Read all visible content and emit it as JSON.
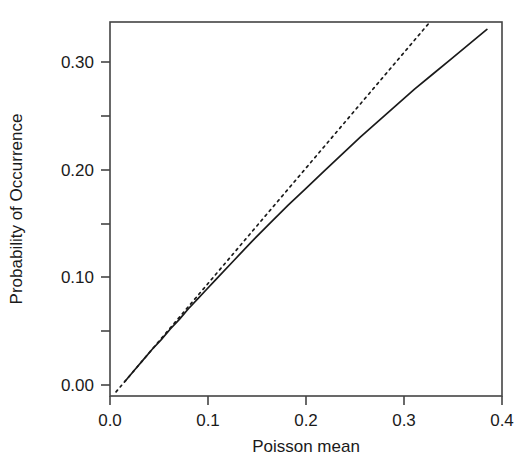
{
  "chart_data": {
    "type": "line",
    "title": "",
    "xlabel": "Poisson mean",
    "ylabel": "Probability of Occurrence",
    "xlim": [
      -0.0167,
      0.4167
    ],
    "ylim": [
      -0.0139,
      0.337
    ],
    "grid": false,
    "legend": "none",
    "xticks": [
      0.0,
      0.1,
      0.2,
      0.3,
      0.4
    ],
    "xtick_labels": [
      "0.0",
      "0.1",
      "0.2",
      "0.3",
      "0.4"
    ],
    "yticks": [
      0.0,
      0.1,
      0.2,
      0.3
    ],
    "ytick_labels": [
      "0.00",
      "0.10",
      "0.20",
      "0.30"
    ],
    "yminor_ticks": [
      0.05,
      0.15,
      0.25
    ],
    "series": [
      {
        "name": "Exact probability of occurrence",
        "style": "solid",
        "color": "#1a1a1a",
        "x": [
          0.0,
          0.01,
          0.02,
          0.03,
          0.04,
          0.05,
          0.06,
          0.07,
          0.08,
          0.09,
          0.1,
          0.12,
          0.14,
          0.16,
          0.18,
          0.2,
          0.22,
          0.24,
          0.26,
          0.28,
          0.3,
          0.32,
          0.34,
          0.36,
          0.38,
          0.4
        ],
        "y": [
          0.0,
          0.01,
          0.02,
          0.03,
          0.039,
          0.049,
          0.058,
          0.068,
          0.077,
          0.086,
          0.095,
          0.113,
          0.131,
          0.148,
          0.165,
          0.181,
          0.197,
          0.213,
          0.229,
          0.244,
          0.259,
          0.274,
          0.288,
          0.302,
          0.316,
          0.33
        ]
      },
      {
        "name": "Linear approximation",
        "style": "dotted",
        "color": "#1a1a1a",
        "x": [
          -0.01,
          0.342
        ],
        "y": [
          -0.01,
          0.342
        ]
      }
    ]
  },
  "axes": {
    "x_title": "Poisson mean",
    "y_title": "Probability of Occurrence",
    "x_tick_labels": [
      "0.0",
      "0.1",
      "0.2",
      "0.3",
      "0.4"
    ],
    "y_tick_labels": [
      "0.00",
      "0.10",
      "0.20",
      "0.30"
    ]
  },
  "colors": {
    "ink": "#1a1a1a",
    "frame": "#444444",
    "background": "#ffffff"
  }
}
